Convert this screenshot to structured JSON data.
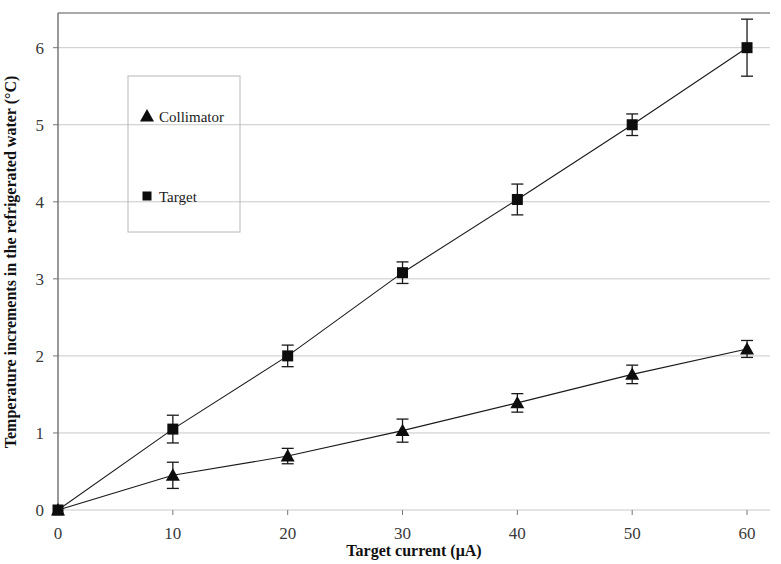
{
  "chart_data": {
    "type": "line",
    "title": "",
    "xlabel": "Target current (μA)",
    "ylabel": "Temperature increments in the refrigerated water (°C)",
    "xlim": [
      0,
      62
    ],
    "ylim": [
      0,
      6.45
    ],
    "xticks": [
      0,
      10,
      20,
      30,
      40,
      50,
      60
    ],
    "yticks": [
      0,
      1,
      2,
      3,
      4,
      5,
      6
    ],
    "xticklabels": [
      "0",
      "10",
      "20",
      "30",
      "40",
      "50",
      "60"
    ],
    "yticklabels": [
      "0",
      "1",
      "2",
      "3",
      "4",
      "5",
      "6"
    ],
    "grid": true,
    "grid_axis": "y",
    "legend_position": "upper-left-inset",
    "x": [
      0,
      10,
      20,
      30,
      40,
      50,
      60
    ],
    "series": [
      {
        "name": "Target",
        "marker": "square",
        "values": [
          0.0,
          1.05,
          2.0,
          3.08,
          4.03,
          5.0,
          6.0
        ],
        "errors": [
          0.0,
          0.18,
          0.14,
          0.14,
          0.2,
          0.14,
          0.37
        ]
      },
      {
        "name": "Collimator",
        "marker": "triangle",
        "values": [
          0.0,
          0.45,
          0.7,
          1.03,
          1.39,
          1.76,
          2.09
        ],
        "errors": [
          0.0,
          0.17,
          0.1,
          0.15,
          0.12,
          0.12,
          0.11
        ]
      }
    ]
  },
  "legend": {
    "entries": [
      {
        "label": "Collimator",
        "marker": "triangle"
      },
      {
        "label": "Target",
        "marker": "square"
      }
    ]
  },
  "colors": {
    "ink": "#0d0d0d",
    "grid": "#c9c9c9",
    "axis": "#555555",
    "tick_text": "#3a3a3a",
    "legend_border": "#b8b8b8",
    "background": "#ffffff"
  }
}
